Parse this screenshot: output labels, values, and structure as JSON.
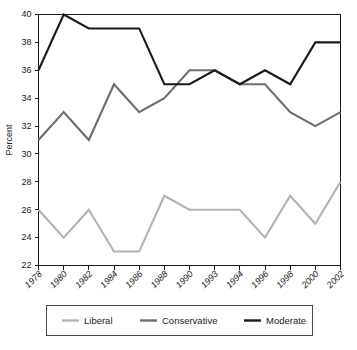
{
  "chart_data": {
    "type": "line",
    "title": "",
    "xlabel": "",
    "ylabel": "Percent",
    "ylim": [
      22,
      40
    ],
    "ytick_step": 2,
    "yticks": [
      22,
      24,
      26,
      28,
      30,
      32,
      34,
      36,
      38,
      40
    ],
    "grid": false,
    "legend_position": "bottom",
    "categories": [
      "1978",
      "1980",
      "1982",
      "1984",
      "1986",
      "1988",
      "1990",
      "1993",
      "1994",
      "1996",
      "1998",
      "2000",
      "2002"
    ],
    "series": [
      {
        "name": "Liberal",
        "color": "#b3b3b3",
        "values": [
          26,
          24,
          26,
          23,
          23,
          27,
          26,
          26,
          26,
          24,
          27,
          25,
          28
        ]
      },
      {
        "name": "Conservative",
        "color": "#6e6e6e",
        "values": [
          31,
          33,
          31,
          35,
          33,
          34,
          36,
          36,
          35,
          35,
          33,
          32,
          33
        ]
      },
      {
        "name": "Moderate",
        "color": "#1a1a1a",
        "values": [
          36,
          40,
          39,
          39,
          39,
          35,
          35,
          36,
          35,
          36,
          35,
          38,
          38
        ]
      }
    ]
  },
  "axis": {
    "y_title": "Percent"
  },
  "legend": {
    "entries": [
      "Liberal",
      "Conservative",
      "Moderate"
    ]
  }
}
